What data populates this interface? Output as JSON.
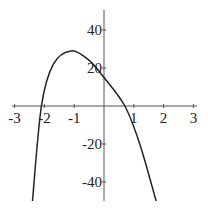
{
  "chart_data": {
    "type": "line",
    "title": "",
    "xlabel": "",
    "ylabel": "",
    "xlim": [
      -3.1,
      3.1
    ],
    "ylim": [
      -50,
      50
    ],
    "xticks": [
      "-3",
      "-2",
      "-1",
      "1",
      "2",
      "3"
    ],
    "yticks": [
      "40",
      "20",
      "-20",
      "-40"
    ],
    "grid": false,
    "series": [
      {
        "name": "f(x)",
        "x": [
          -2.4,
          -2.1,
          -1.7,
          -1.1,
          -0.5,
          0,
          0.7,
          1.2,
          1.75
        ],
        "y": [
          -50,
          0,
          22,
          29,
          24,
          15,
          0,
          -20,
          -50
        ]
      }
    ]
  }
}
